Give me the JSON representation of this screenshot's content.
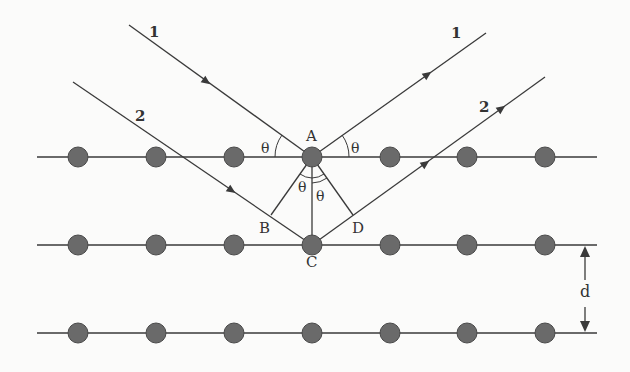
{
  "colors": {
    "line": "#3a3a3a",
    "atom_fill": "#6a6a6a",
    "atom_stroke": "#4a4a4a",
    "background": "#fbfbfa"
  },
  "lattice": {
    "rows_y": [
      157,
      245,
      333
    ],
    "atoms_x": [
      78,
      156,
      234,
      312,
      390,
      467,
      545
    ],
    "line_x_start": 37,
    "line_x_end": 597,
    "atom_radius": 10
  },
  "rays": [
    {
      "label": "1",
      "role": "incident",
      "from": [
        129,
        25
      ],
      "to": [
        312,
        157
      ]
    },
    {
      "label": "2",
      "role": "incident",
      "from": [
        73,
        82
      ],
      "to": [
        312,
        245
      ]
    },
    {
      "label": "1",
      "role": "reflected",
      "from": [
        312,
        157
      ],
      "to": [
        486,
        33
      ]
    },
    {
      "label": "2",
      "role": "reflected",
      "from": [
        312,
        245
      ],
      "to": [
        545,
        77
      ]
    }
  ],
  "points": {
    "A": {
      "label": "A",
      "x": 312,
      "y": 157
    },
    "B": {
      "label": "B",
      "x": 271,
      "y": 215
    },
    "C": {
      "label": "C",
      "x": 312,
      "y": 245
    },
    "D": {
      "label": "D",
      "x": 353,
      "y": 215
    }
  },
  "labels": {
    "ray1_in": "1",
    "ray2_in": "2",
    "ray1_out": "1",
    "ray2_out": "2",
    "point_a": "A",
    "point_b": "B",
    "point_c": "C",
    "point_d": "D",
    "theta_left": "θ",
    "theta_right": "θ",
    "theta_ab": "θ",
    "theta_ad": "θ",
    "spacing": "d"
  }
}
